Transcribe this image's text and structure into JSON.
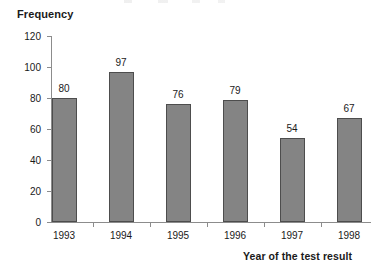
{
  "chart_data": {
    "type": "bar",
    "title": "",
    "xlabel": "Year of the test result",
    "ylabel": "Frequency",
    "categories": [
      "1993",
      "1994",
      "1995",
      "1996",
      "1997",
      "1998"
    ],
    "values": [
      80,
      97,
      76,
      79,
      54,
      67
    ],
    "value_labels": [
      "80",
      "97",
      "76",
      "79",
      "54",
      "67"
    ],
    "ylim": [
      0,
      120
    ],
    "ytick_values": [
      0,
      20,
      40,
      60,
      80,
      100,
      120
    ],
    "ytick_labels": [
      "0",
      "20",
      "40",
      "60",
      "80",
      "100",
      "120"
    ],
    "grid": false,
    "legend": "none",
    "bar_color": "#848484",
    "bar_border_color": "#4d4d4d",
    "axis_color": "#8c8c8c",
    "text_color": "#1a1a1a",
    "background": "#ffffff"
  }
}
